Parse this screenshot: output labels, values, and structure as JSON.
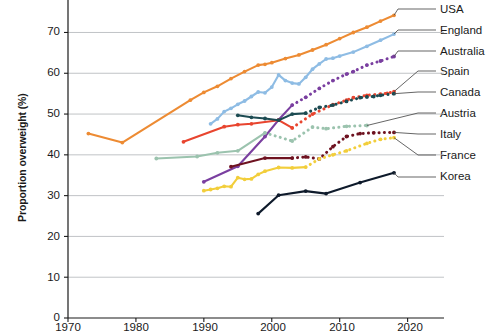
{
  "chart_data": {
    "type": "line",
    "title": "",
    "xlabel": "",
    "ylabel": "Proportion overweight (%)",
    "xlim": [
      1970,
      2023
    ],
    "ylim": [
      0,
      76
    ],
    "xticks": [
      1970,
      1980,
      1990,
      2000,
      2010,
      2020
    ],
    "yticks": [
      0,
      10,
      20,
      30,
      40,
      50,
      60,
      70
    ],
    "grid": "horizontal",
    "legend_position": "right-labels-with-leader-lines",
    "series": [
      {
        "name": "USA",
        "color": "#ED8B33",
        "label_y": 9,
        "points": [
          [
            1973,
            45.2
          ],
          [
            1978,
            43.0
          ],
          [
            1988,
            53.4
          ],
          [
            1990,
            55.3
          ],
          [
            1992,
            56.8
          ],
          [
            1994,
            58.7
          ],
          [
            1996,
            60.4
          ],
          [
            1998,
            62.0
          ],
          [
            1999,
            62.2
          ],
          [
            2000,
            62.6
          ],
          [
            2002,
            63.6
          ],
          [
            2004,
            64.5
          ],
          [
            2006,
            65.7
          ],
          [
            2008,
            67.0
          ],
          [
            2010,
            68.5
          ],
          [
            2012,
            70.0
          ],
          [
            2014,
            71.3
          ],
          [
            2016,
            72.8
          ],
          [
            2018,
            74.2
          ]
        ]
      },
      {
        "name": "England",
        "color": "#8EBCE4",
        "label_y": 30,
        "points": [
          [
            1991,
            47.6
          ],
          [
            1992,
            48.8
          ],
          [
            1993,
            50.6
          ],
          [
            1994,
            51.4
          ],
          [
            1995,
            52.4
          ],
          [
            1996,
            53.2
          ],
          [
            1997,
            54.3
          ],
          [
            1998,
            55.4
          ],
          [
            1999,
            55.2
          ],
          [
            2000,
            56.6
          ],
          [
            2001,
            59.6
          ],
          [
            2002,
            58.2
          ],
          [
            2003,
            57.6
          ],
          [
            2004,
            57.4
          ],
          [
            2005,
            59.0
          ],
          [
            2006,
            61.0
          ],
          [
            2007,
            62.3
          ],
          [
            2008,
            63.5
          ],
          [
            2009,
            63.7
          ],
          [
            2010,
            64.2
          ],
          [
            2012,
            65.2
          ],
          [
            2014,
            66.6
          ],
          [
            2016,
            68.1
          ],
          [
            2018,
            69.6
          ]
        ]
      },
      {
        "name": "Australia",
        "color": "#7A3FA0",
        "label_y": 51,
        "points": [
          [
            1990,
            33.4
          ],
          [
            1995,
            37.2
          ],
          [
            1999,
            44.5
          ],
          [
            2001,
            48.6
          ],
          [
            2003,
            52.2
          ],
          [
            2005,
            54.1
          ],
          [
            2007,
            56.3
          ],
          [
            2009,
            58.2
          ],
          [
            2011,
            59.8
          ],
          [
            2012,
            60.4
          ],
          [
            2014,
            62.0
          ],
          [
            2016,
            63.0
          ],
          [
            2018,
            64.1
          ]
        ],
        "dashed_from": 2003
      },
      {
        "name": "Spain",
        "color": "#E8452F",
        "label_y": 71,
        "points": [
          [
            1987,
            43.2
          ],
          [
            1993,
            46.9
          ],
          [
            1995,
            47.4
          ],
          [
            1997,
            47.6
          ],
          [
            2001,
            48.5
          ],
          [
            2003,
            46.6
          ],
          [
            2006,
            50.0
          ],
          [
            2009,
            52.3
          ],
          [
            2011,
            53.4
          ],
          [
            2012,
            54.0
          ],
          [
            2014,
            54.6
          ],
          [
            2016,
            54.9
          ],
          [
            2017,
            55.1
          ],
          [
            2018,
            55.5
          ]
        ],
        "dashed_from": 2003
      },
      {
        "name": "Canada",
        "color": "#1C4B52",
        "label_y": 92,
        "points": [
          [
            1995,
            49.7
          ],
          [
            1997,
            49.2
          ],
          [
            1999,
            48.9
          ],
          [
            2001,
            48.5
          ],
          [
            2003,
            50.0
          ],
          [
            2005,
            50.2
          ],
          [
            2007,
            51.6
          ],
          [
            2009,
            52.2
          ],
          [
            2011,
            53.1
          ],
          [
            2013,
            54.0
          ],
          [
            2014,
            54.2
          ],
          [
            2015,
            54.3
          ],
          [
            2016,
            54.6
          ],
          [
            2018,
            55.0
          ]
        ],
        "dashed_from": 2005
      },
      {
        "name": "Austria",
        "color": "#9BC3AE",
        "label_y": 113,
        "points": [
          [
            1983,
            39.1
          ],
          [
            1989,
            39.6
          ],
          [
            1992,
            40.5
          ],
          [
            1995,
            41.0
          ],
          [
            1999,
            45.4
          ],
          [
            2003,
            43.4
          ],
          [
            2006,
            46.8
          ],
          [
            2008,
            46.4
          ],
          [
            2011,
            47.0
          ],
          [
            2014,
            47.2
          ]
        ],
        "dashed_from": 1999
      },
      {
        "name": "Italy",
        "color": "#6E1220",
        "label_y": 134,
        "points": [
          [
            1994,
            37.1
          ],
          [
            1999,
            39.2
          ],
          [
            2003,
            39.2
          ],
          [
            2005,
            39.5
          ],
          [
            2007,
            39.0
          ],
          [
            2009,
            42.0
          ],
          [
            2011,
            44.5
          ],
          [
            2013,
            45.2
          ],
          [
            2015,
            45.4
          ],
          [
            2018,
            45.5
          ]
        ],
        "dashed_from": 2003
      },
      {
        "name": "France",
        "color": "#F2CE3B",
        "label_y": 155,
        "points": [
          [
            1990,
            31.2
          ],
          [
            1991,
            31.5
          ],
          [
            1992,
            31.8
          ],
          [
            1993,
            32.3
          ],
          [
            1994,
            32.2
          ],
          [
            1995,
            34.4
          ],
          [
            1996,
            34.0
          ],
          [
            1997,
            34.1
          ],
          [
            1998,
            35.2
          ],
          [
            1999,
            36.0
          ],
          [
            2001,
            36.9
          ],
          [
            2003,
            36.8
          ],
          [
            2005,
            37.0
          ],
          [
            2007,
            39.0
          ],
          [
            2009,
            40.0
          ],
          [
            2011,
            41.0
          ],
          [
            2014,
            42.8
          ],
          [
            2016,
            43.8
          ],
          [
            2018,
            44.2
          ]
        ],
        "dashed_from": 2005
      },
      {
        "name": "Korea",
        "color": "#0E1A2B",
        "label_y": 177,
        "points": [
          [
            1998,
            25.6
          ],
          [
            2001,
            30.1
          ],
          [
            2005,
            31.1
          ],
          [
            2008,
            30.5
          ],
          [
            2013,
            33.2
          ],
          [
            2018,
            35.6
          ]
        ]
      }
    ]
  },
  "axes": {
    "y_title": "Proportion overweight (%)",
    "x_tick_labels": [
      "1970",
      "1980",
      "1990",
      "2000",
      "2010",
      "2020"
    ],
    "y_tick_labels": [
      "0",
      "10",
      "20",
      "30",
      "40",
      "50",
      "60",
      "70"
    ]
  },
  "labels": {
    "usa": "USA",
    "england": "England",
    "australia": "Australia",
    "spain": "Spain",
    "canada": "Canada",
    "austria": "Austria",
    "italy": "Italy",
    "france": "France",
    "korea": "Korea"
  },
  "colors": {
    "axis": "#1a1a1a",
    "grid": "#b9bcc0",
    "leader": "#4a4a4a",
    "background": "#ffffff"
  }
}
